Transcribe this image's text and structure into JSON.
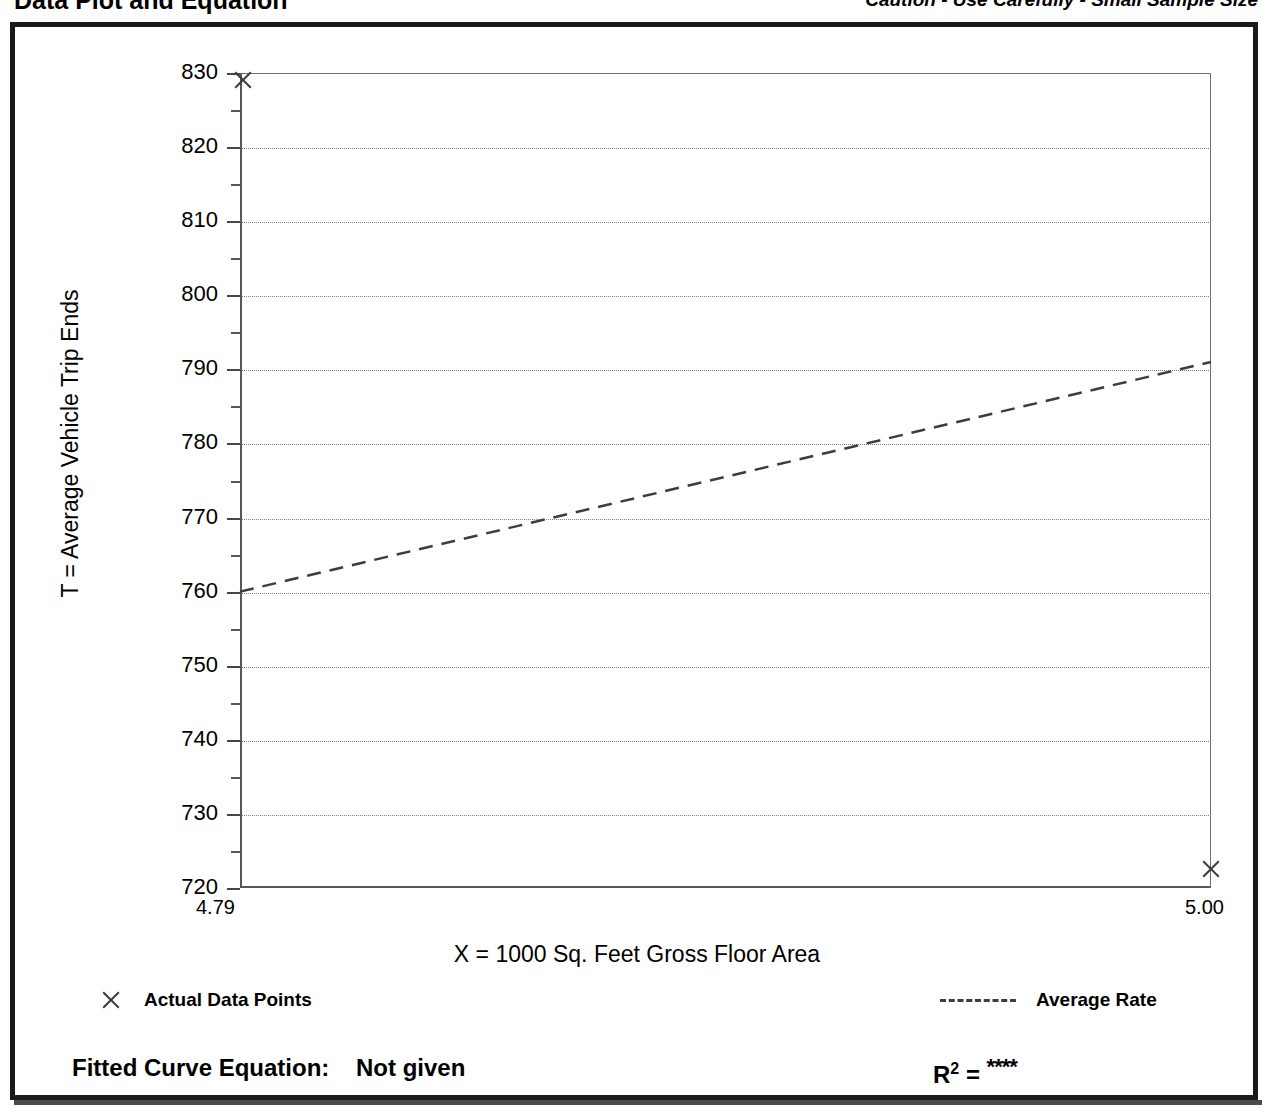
{
  "header": {
    "title": "Data Plot and Equation",
    "caution": "Caution - Use Carefully - Small Sample Size"
  },
  "footer": {
    "fitted_curve_prefix": "Fitted Curve Equation:",
    "fitted_curve_value": "Not given",
    "r_squared_symbol": "R",
    "r_squared_exponent": "2",
    "r_squared_equals": " = ",
    "r_squared_value": "****"
  },
  "legend": {
    "data_points_label": "Actual Data Points",
    "average_rate_label": "Average Rate"
  },
  "chart_data": {
    "type": "scatter",
    "title": "Data Plot and Equation",
    "xlabel": "X = 1000 Sq. Feet Gross Floor Area",
    "ylabel": "T = Average Vehicle Trip Ends",
    "xlim": [
      4.79,
      5.0
    ],
    "ylim": [
      720,
      830
    ],
    "x_tick_labels": [
      "4.79",
      "5.00"
    ],
    "y_ticks": [
      720,
      730,
      740,
      750,
      760,
      770,
      780,
      790,
      800,
      810,
      820,
      830
    ],
    "y_tick_labels": [
      "720",
      "730",
      "740",
      "750",
      "760",
      "770",
      "780",
      "790",
      "800",
      "810",
      "820",
      "830"
    ],
    "y_minor_ticks": [
      725,
      735,
      745,
      755,
      765,
      775,
      785,
      795,
      805,
      815,
      825
    ],
    "grid": "horizontal-dotted",
    "legend_position": "below-axes",
    "series": [
      {
        "name": "Actual Data Points",
        "type": "scatter",
        "marker": "x",
        "points": [
          {
            "x": 4.7907,
            "y": 829.0
          },
          {
            "x": 5.0,
            "y": 722.5
          }
        ]
      },
      {
        "name": "Average Rate",
        "type": "line",
        "style": "dashed",
        "points": [
          {
            "x": 4.79,
            "y": 760.0
          },
          {
            "x": 5.0,
            "y": 791.0
          }
        ]
      }
    ],
    "annotations": {
      "fitted_curve_equation": "Not given",
      "r_squared": "****",
      "caution": "Caution - Use Carefully - Small Sample Size"
    }
  }
}
